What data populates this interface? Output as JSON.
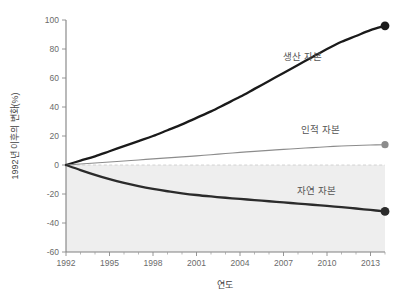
{
  "chart_data": {
    "type": "line",
    "title": "",
    "xlabel": "연도",
    "ylabel": "1992년 이후의 변화(%)",
    "xlim": [
      1992,
      2014
    ],
    "ylim": [
      -60,
      100
    ],
    "yticks": [
      100,
      80,
      60,
      40,
      20,
      0,
      -20,
      -40,
      -60
    ],
    "xticks": [
      1992,
      1995,
      1998,
      2001,
      2004,
      2007,
      2010,
      2013
    ],
    "grid": false,
    "legend_position": "inline-annotations",
    "zero_reference_line": true,
    "shaded_negative_region": true,
    "series": [
      {
        "name": "생산 자본",
        "color": "#1a1a1a",
        "style": "thick-solid",
        "endpoint_marker": true,
        "endpoint_value": 96,
        "x": [
          1992,
          1993,
          1994,
          1995,
          1996,
          1997,
          1998,
          1999,
          2000,
          2001,
          2002,
          2003,
          2004,
          2005,
          2006,
          2007,
          2008,
          2009,
          2010,
          2011,
          2012,
          2013,
          2014
        ],
        "values": [
          0,
          3,
          6,
          9.5,
          13,
          16.5,
          20,
          24,
          28,
          32.5,
          37,
          42,
          47,
          52.5,
          58,
          63.5,
          69,
          74.5,
          80,
          85,
          89,
          93,
          96
        ]
      },
      {
        "name": "인적 자본",
        "color": "#8c8c8c",
        "style": "thin-solid",
        "endpoint_marker": true,
        "endpoint_value": 14,
        "x": [
          1992,
          1993,
          1994,
          1995,
          1996,
          1997,
          1998,
          1999,
          2000,
          2001,
          2002,
          2003,
          2004,
          2005,
          2006,
          2007,
          2008,
          2009,
          2010,
          2011,
          2012,
          2013,
          2014
        ],
        "values": [
          0,
          0.7,
          1.4,
          2.1,
          2.8,
          3.5,
          4.2,
          4.9,
          5.6,
          6.3,
          7.1,
          7.9,
          8.7,
          9.4,
          10.1,
          10.8,
          11.4,
          12.0,
          12.6,
          13.1,
          13.5,
          13.8,
          14
        ]
      },
      {
        "name": "자연 자본",
        "color": "#2b2b2b",
        "style": "thick-solid",
        "endpoint_marker": true,
        "endpoint_value": -32,
        "x": [
          1992,
          1993,
          1994,
          1995,
          1996,
          1997,
          1998,
          1999,
          2000,
          2001,
          2002,
          2003,
          2004,
          2005,
          2006,
          2007,
          2008,
          2009,
          2010,
          2011,
          2012,
          2013,
          2014
        ],
        "values": [
          0,
          -3.5,
          -6.8,
          -9.8,
          -12.4,
          -14.6,
          -16.5,
          -18.1,
          -19.5,
          -20.7,
          -21.7,
          -22.6,
          -23.4,
          -24.2,
          -25.0,
          -25.8,
          -26.6,
          -27.4,
          -28.2,
          -29.1,
          -30.0,
          -31.0,
          -32
        ]
      }
    ],
    "annotations": [
      {
        "text": "생산 자본",
        "x_px": 283,
        "y_px": 60
      },
      {
        "text": "인적 자본",
        "x_px": 301,
        "y_px": 133
      },
      {
        "text": "자연 자본",
        "x_px": 297,
        "y_px": 194
      }
    ]
  }
}
